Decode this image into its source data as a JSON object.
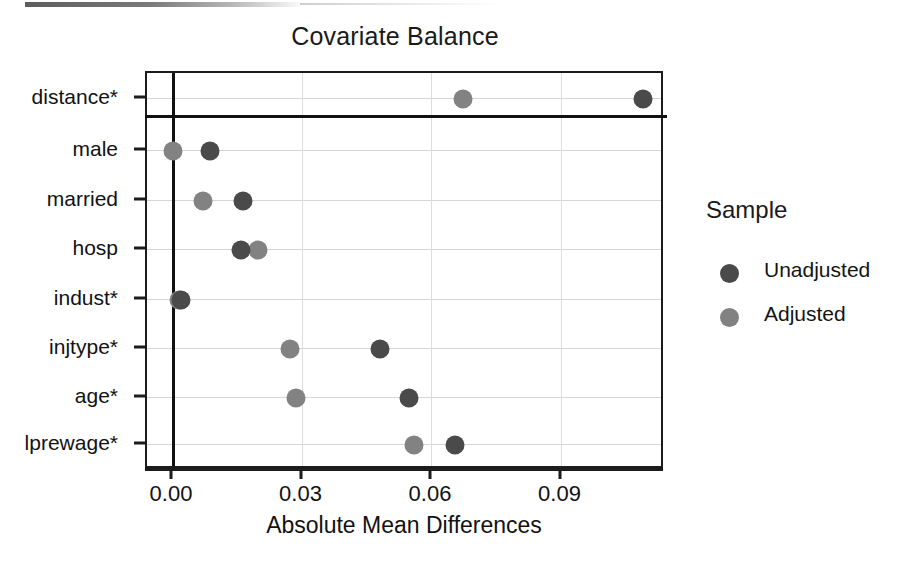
{
  "chart_data": {
    "type": "scatter",
    "title": "Covariate Balance",
    "xlabel": "Absolute Mean Differences",
    "ylabel": "",
    "xlim": [
      -0.006,
      0.114
    ],
    "xticks": [
      0.0,
      0.03,
      0.06,
      0.09
    ],
    "xticklabels": [
      "0.00",
      "0.03",
      "0.06",
      "0.09"
    ],
    "categories": [
      "distance*",
      "male",
      "married",
      "hosp",
      "indust*",
      "injtype*",
      "age*",
      "lprewage*"
    ],
    "grid": true,
    "legend_position": "right",
    "legend_title": "Sample",
    "reference_line_x": 0.0,
    "separator_after_category": "distance*",
    "series": [
      {
        "name": "Unadjusted",
        "color": "#4a4a4a",
        "values": [
          0.1089,
          0.0086,
          0.0162,
          0.0158,
          0.0019,
          0.048,
          0.0547,
          0.0653
        ]
      },
      {
        "name": "Adjusted",
        "color": "#828282",
        "values": [
          0.0672,
          0.0,
          0.007,
          0.0197,
          0.0014,
          0.0271,
          0.0285,
          0.0558
        ]
      }
    ]
  },
  "legend": {
    "title": "Sample",
    "entries": [
      {
        "label": "Unadjusted",
        "key": "unadj"
      },
      {
        "label": "Adjusted",
        "key": "adj"
      }
    ]
  }
}
